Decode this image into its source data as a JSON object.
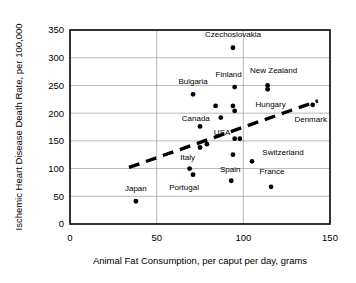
{
  "chart_data": {
    "type": "scatter",
    "title": "",
    "xlabel": "Animal Fat Consumption, per caput per day, grams",
    "ylabel": "Ischemic Heart Disease Death Rate, per 100,000",
    "xlim": [
      0,
      150
    ],
    "ylim": [
      0,
      350
    ],
    "xticks": [
      0,
      50,
      100,
      150
    ],
    "yticks": [
      0,
      50,
      100,
      150,
      200,
      250,
      300,
      350
    ],
    "xtick_labels": [
      "0",
      "50",
      "100",
      "150"
    ],
    "ytick_labels": [
      "0",
      "50",
      "100",
      "150",
      "200",
      "250",
      "300",
      "350"
    ],
    "grid": true,
    "legend": "none",
    "point_color": "#000000",
    "grid_color": "#9a9a9a",
    "frame_color": "#000000",
    "points": [
      {
        "label": "Czechoslovakia",
        "x": 94,
        "y": 318,
        "label_dx": 0,
        "label_dy": -11,
        "label_anchor": "middle"
      },
      {
        "label": "Finland",
        "x": 95,
        "y": 247,
        "label_dx": -6,
        "label_dy": -10,
        "label_anchor": "middle"
      },
      {
        "label": "New Zealand",
        "x": 114,
        "y": 250,
        "label_dx": 6,
        "label_dy": -12,
        "label_anchor": "middle"
      },
      {
        "label": "Bulgaria",
        "x": 71,
        "y": 234,
        "label_dx": 0,
        "label_dy": -10,
        "label_anchor": "middle"
      },
      {
        "label": "Hungary",
        "x": 114,
        "y": 243,
        "label_dx": 3,
        "label_dy": 18,
        "label_anchor": "middle"
      },
      {
        "label": "Denmark",
        "x": 140,
        "y": 215,
        "label_dx": -2,
        "label_dy": 17,
        "label_anchor": "middle"
      },
      {
        "label": "Canada",
        "x": 87,
        "y": 192,
        "label_dx": -25,
        "label_dy": 3,
        "label_anchor": "middle"
      },
      {
        "label": "USA",
        "x": 75,
        "y": 176,
        "label_dx": 22,
        "label_dy": 9,
        "label_anchor": "middle"
      },
      {
        "label": "Switzerland",
        "x": 105,
        "y": 113,
        "label_dx": 31,
        "label_dy": -6,
        "label_anchor": "middle"
      },
      {
        "label": "Italy",
        "x": 69,
        "y": 100,
        "label_dx": -2,
        "label_dy": -9,
        "label_anchor": "middle"
      },
      {
        "label": "Portugal",
        "x": 71,
        "y": 89,
        "label_dx": -9,
        "label_dy": 15,
        "label_anchor": "middle"
      },
      {
        "label": "Spain",
        "x": 93,
        "y": 78,
        "label_dx": -1,
        "label_dy": -9,
        "label_anchor": "middle"
      },
      {
        "label": "France",
        "x": 116,
        "y": 67,
        "label_dx": 1,
        "label_dy": -13,
        "label_anchor": "middle"
      },
      {
        "label": "Japan",
        "x": 38,
        "y": 41,
        "label_dx": 0,
        "label_dy": -10,
        "label_anchor": "middle"
      },
      {
        "label": "",
        "x": 84,
        "y": 213,
        "label_dx": 0,
        "label_dy": 0,
        "label_anchor": "middle"
      },
      {
        "label": "",
        "x": 94,
        "y": 213,
        "label_dx": 0,
        "label_dy": 0,
        "label_anchor": "middle"
      },
      {
        "label": "",
        "x": 95,
        "y": 204,
        "label_dx": 0,
        "label_dy": 0,
        "label_anchor": "middle"
      },
      {
        "label": "",
        "x": 95,
        "y": 154,
        "label_dx": 0,
        "label_dy": 0,
        "label_anchor": "middle"
      },
      {
        "label": "",
        "x": 98,
        "y": 154,
        "label_dx": 0,
        "label_dy": 0,
        "label_anchor": "middle"
      },
      {
        "label": "",
        "x": 79,
        "y": 144,
        "label_dx": 0,
        "label_dy": 0,
        "label_anchor": "middle"
      },
      {
        "label": "",
        "x": 75,
        "y": 138,
        "label_dx": 0,
        "label_dy": 0,
        "label_anchor": "middle"
      },
      {
        "label": "",
        "x": 94,
        "y": 125,
        "label_dx": 0,
        "label_dy": 0,
        "label_anchor": "middle"
      }
    ],
    "trendline": {
      "style": "dashed",
      "x_start": 34,
      "y_start": 102,
      "x_end": 143,
      "y_end": 222
    }
  }
}
